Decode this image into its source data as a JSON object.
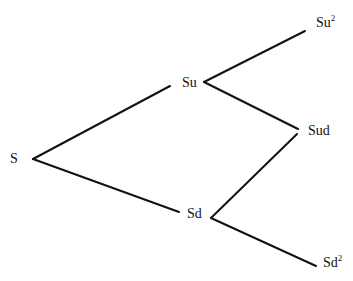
{
  "diagram": {
    "type": "binomial-tree",
    "nodes": [
      {
        "id": "S",
        "label": "S",
        "sup": "",
        "x": 10,
        "y": 152
      },
      {
        "id": "Su",
        "label": "Su",
        "sup": "",
        "x": 182,
        "y": 76
      },
      {
        "id": "Sd",
        "label": "Sd",
        "sup": "",
        "x": 187,
        "y": 207
      },
      {
        "id": "Su2",
        "label": "Su",
        "sup": "2",
        "x": 316,
        "y": 16
      },
      {
        "id": "Sud",
        "label": "Sud",
        "sup": "",
        "x": 308,
        "y": 124
      },
      {
        "id": "Sd2",
        "label": "Sd",
        "sup": "2",
        "x": 323,
        "y": 256
      }
    ],
    "edges": [
      {
        "from": "S",
        "to": "Su",
        "x1": 33,
        "y1": 159,
        "x2": 170,
        "y2": 86
      },
      {
        "from": "S",
        "to": "Sd",
        "x1": 33,
        "y1": 159,
        "x2": 179,
        "y2": 212
      },
      {
        "from": "Su",
        "to": "Su2",
        "x1": 204,
        "y1": 82,
        "x2": 305,
        "y2": 31
      },
      {
        "from": "Su",
        "to": "Sud",
        "x1": 204,
        "y1": 82,
        "x2": 298,
        "y2": 129
      },
      {
        "from": "Sd",
        "to": "Sud",
        "x1": 211,
        "y1": 218,
        "x2": 297,
        "y2": 134
      },
      {
        "from": "Sd",
        "to": "Sd2",
        "x1": 211,
        "y1": 218,
        "x2": 316,
        "y2": 266
      }
    ]
  }
}
